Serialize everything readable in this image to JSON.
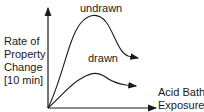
{
  "diagram": {
    "y_axis_label": [
      "Rate of",
      "Property",
      "Change",
      "[10 min]"
    ],
    "x_axis_label": [
      "Acid Bath",
      "Exposure"
    ],
    "curves": [
      {
        "name": "undrawn",
        "label": "undrawn"
      },
      {
        "name": "drawn",
        "label": "drawn"
      }
    ]
  }
}
